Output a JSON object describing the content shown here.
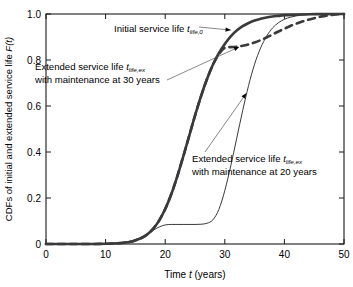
{
  "chart_data": {
    "type": "line",
    "title": "",
    "xlabel": "Time t (years)",
    "ylabel": "CDFs of initial and extended service life F(t)",
    "xlim": [
      0,
      50
    ],
    "ylim": [
      0,
      1.0
    ],
    "xticks": [
      0,
      10,
      20,
      30,
      40,
      50
    ],
    "yticks": [
      0,
      0.2,
      0.4,
      0.6,
      0.8,
      1.0
    ],
    "xticklabels": [
      "0",
      "10",
      "20",
      "30",
      "40",
      "50"
    ],
    "yticklabels": [
      "0",
      "0.2",
      "0.4",
      "0.6",
      "0.8",
      "1.0"
    ],
    "grid": false,
    "legend": "none",
    "series": [
      {
        "name": "Initial service life t_life,0",
        "style": "solid-thick",
        "color": "#3a3a3a",
        "width": 2.6,
        "points": [
          [
            0,
            0.0
          ],
          [
            2,
            0.0
          ],
          [
            4,
            0.0
          ],
          [
            6,
            0.0
          ],
          [
            8,
            0.0002
          ],
          [
            10,
            0.0008
          ],
          [
            12,
            0.003
          ],
          [
            14,
            0.009
          ],
          [
            15,
            0.016
          ],
          [
            16,
            0.026
          ],
          [
            17,
            0.042
          ],
          [
            18,
            0.067
          ],
          [
            19,
            0.103
          ],
          [
            20,
            0.152
          ],
          [
            21,
            0.215
          ],
          [
            22,
            0.292
          ],
          [
            23,
            0.378
          ],
          [
            24,
            0.468
          ],
          [
            25,
            0.558
          ],
          [
            26,
            0.642
          ],
          [
            27,
            0.716
          ],
          [
            28,
            0.779
          ],
          [
            29,
            0.83
          ],
          [
            30,
            0.87
          ],
          [
            31,
            0.903
          ],
          [
            32,
            0.928
          ],
          [
            33,
            0.947
          ],
          [
            34,
            0.961
          ],
          [
            35,
            0.972
          ],
          [
            36,
            0.979
          ],
          [
            37,
            0.985
          ],
          [
            38,
            0.989
          ],
          [
            39,
            0.992
          ],
          [
            40,
            0.995
          ],
          [
            42,
            0.997
          ],
          [
            44,
            0.999
          ],
          [
            46,
            0.9995
          ],
          [
            48,
            0.9998
          ],
          [
            50,
            1.0
          ]
        ]
      },
      {
        "name": "Extended service life t_life,ex with maintenance at 30 years",
        "style": "dashed",
        "color": "#3a3a3a",
        "width": 2.6,
        "dash": "7,5",
        "points": [
          [
            0,
            0.0
          ],
          [
            2,
            0.0
          ],
          [
            4,
            0.0
          ],
          [
            6,
            0.0
          ],
          [
            8,
            0.0002
          ],
          [
            10,
            0.0008
          ],
          [
            12,
            0.003
          ],
          [
            14,
            0.009
          ],
          [
            15,
            0.016
          ],
          [
            16,
            0.026
          ],
          [
            17,
            0.042
          ],
          [
            18,
            0.067
          ],
          [
            19,
            0.103
          ],
          [
            20,
            0.152
          ],
          [
            21,
            0.215
          ],
          [
            22,
            0.292
          ],
          [
            23,
            0.378
          ],
          [
            24,
            0.468
          ],
          [
            25,
            0.558
          ],
          [
            26,
            0.642
          ],
          [
            27,
            0.716
          ],
          [
            28,
            0.779
          ],
          [
            29,
            0.825
          ],
          [
            30,
            0.853
          ],
          [
            31,
            0.856
          ],
          [
            32,
            0.858
          ],
          [
            33,
            0.862
          ],
          [
            34,
            0.868
          ],
          [
            35,
            0.876
          ],
          [
            36,
            0.886
          ],
          [
            37,
            0.898
          ],
          [
            38,
            0.911
          ],
          [
            39,
            0.924
          ],
          [
            40,
            0.936
          ],
          [
            41,
            0.948
          ],
          [
            42,
            0.958
          ],
          [
            43,
            0.967
          ],
          [
            44,
            0.975
          ],
          [
            45,
            0.982
          ],
          [
            46,
            0.988
          ],
          [
            47,
            0.992
          ],
          [
            48,
            0.996
          ],
          [
            49,
            0.999
          ],
          [
            50,
            1.0
          ]
        ]
      },
      {
        "name": "Extended service life t_life,ex with maintenance at 20 years",
        "style": "solid-thin",
        "color": "#3a3a3a",
        "width": 1.0,
        "points": [
          [
            0,
            0.0
          ],
          [
            2,
            0.0
          ],
          [
            4,
            0.0
          ],
          [
            6,
            0.0
          ],
          [
            8,
            0.0002
          ],
          [
            10,
            0.0008
          ],
          [
            12,
            0.003
          ],
          [
            14,
            0.009
          ],
          [
            15,
            0.016
          ],
          [
            16,
            0.026
          ],
          [
            17,
            0.042
          ],
          [
            18,
            0.06
          ],
          [
            19,
            0.074
          ],
          [
            20,
            0.083
          ],
          [
            21,
            0.085
          ],
          [
            22,
            0.085
          ],
          [
            23,
            0.085
          ],
          [
            24,
            0.085
          ],
          [
            25,
            0.085
          ],
          [
            26,
            0.086
          ],
          [
            27,
            0.09
          ],
          [
            28,
            0.105
          ],
          [
            29,
            0.15
          ],
          [
            30,
            0.232
          ],
          [
            31,
            0.34
          ],
          [
            32,
            0.46
          ],
          [
            33,
            0.58
          ],
          [
            34,
            0.69
          ],
          [
            35,
            0.782
          ],
          [
            36,
            0.852
          ],
          [
            37,
            0.903
          ],
          [
            38,
            0.939
          ],
          [
            39,
            0.962
          ],
          [
            40,
            0.977
          ],
          [
            41,
            0.986
          ],
          [
            42,
            0.992
          ],
          [
            43,
            0.995
          ],
          [
            44,
            0.997
          ],
          [
            45,
            0.9985
          ],
          [
            46,
            0.9992
          ],
          [
            47,
            0.9996
          ],
          [
            48,
            0.9998
          ],
          [
            49,
            0.9999
          ],
          [
            50,
            1.0
          ]
        ]
      }
    ],
    "annotations": [
      {
        "id": "initial-service-life",
        "lines": [
          "Initial service life t",
          "life,0"
        ],
        "text_main": "Initial service life ",
        "italic_var": "t",
        "subscript": "life,0",
        "target": [
          31.0,
          0.93
        ]
      },
      {
        "id": "extended-30-years",
        "lines": [
          "Extended service life t",
          "life,ex",
          "with maintenance at 30 years"
        ],
        "text_line1_main": "Extended service life ",
        "italic_var": "t",
        "subscript": "life,ex",
        "text_line2": "with maintenance at 30 years",
        "target": [
          32.4,
          0.857
        ]
      },
      {
        "id": "extended-20-years",
        "lines": [
          "Extended service life t",
          "life,ex",
          "with maintenance at 20 years"
        ],
        "text_line1_main": "Extended service life ",
        "italic_var": "t",
        "subscript": "life,ex",
        "text_line2": "with maintenance at 20 years",
        "target": [
          33.6,
          0.655
        ]
      }
    ]
  },
  "axis": {
    "x_label_main": "Time ",
    "x_label_var": "t",
    "x_label_unit": " (years)",
    "y_label_main": "CDFs of initial and extended service life ",
    "y_label_var": "F",
    "y_label_arg": "(t)"
  },
  "colors": {
    "background": "#ffffff",
    "axis": "#1a1a1a",
    "curve": "#3a3a3a",
    "text": "#000000"
  }
}
